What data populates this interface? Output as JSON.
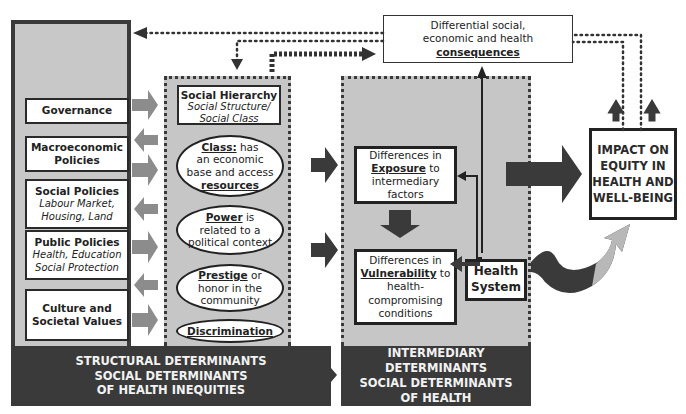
{
  "structural": {
    "policies": [
      {
        "title": "Governance",
        "subtitle": ""
      },
      {
        "title": "Macroeconomic Policies",
        "subtitle": ""
      },
      {
        "title": "Social Policies",
        "subtitle": "Labour Market, Housing, Land"
      },
      {
        "title": "Public Policies",
        "subtitle": "Health, Education Social Protection"
      },
      {
        "title": "Culture and Societal Values",
        "subtitle": ""
      }
    ],
    "label_lines": [
      "STRUCTURAL DETERMINANTS",
      "SOCIAL DETERMINANTS",
      "OF HEALTH INEQUITIES"
    ]
  },
  "hierarchy": {
    "title": "Social Hierarchy",
    "subtitle_1": "Social Structure/",
    "subtitle_2": "Social Class",
    "class": {
      "key": "Class:",
      "text_1": " has",
      "text_2": "an economic",
      "text_3": "base and access",
      "key_2": "resources"
    },
    "power": {
      "key": "Power",
      "text_1": " is",
      "text_2": "related to a",
      "text_3": "political context"
    },
    "prestige": {
      "key": "Prestige",
      "text_1": " or",
      "text_2": "honor in the",
      "text_3": "community"
    },
    "discrimination": {
      "key": "Discrimination"
    }
  },
  "intermediary": {
    "exposure": {
      "line_1": "Differences in",
      "key": "Exposure",
      "after_key": " to",
      "line_3": "intermediary",
      "line_4": "factors"
    },
    "vulnerability": {
      "line_1": "Differences in",
      "key": "Vulnerability",
      "after_key": " to",
      "line_3": "health-",
      "line_4": "compromising",
      "line_5": "conditions"
    },
    "health_system": {
      "line_1": "Health",
      "line_2": "System"
    },
    "label_lines": [
      "INTERMEDIARY DETERMINANTS",
      "SOCIAL DETERMINANTS",
      "OF HEALTH"
    ]
  },
  "consequences": {
    "line_1": "Differential social,",
    "line_2": "economic and health",
    "key": "consequences"
  },
  "impact": {
    "lines": [
      "IMPACT ON",
      "EQUITY IN",
      "HEALTH AND",
      "WELL-BEING"
    ]
  },
  "colors": {
    "dark": "#3a3a3a",
    "panel_gray": "#c6c6c6",
    "arrow_gray": "#8c8c8c",
    "light_arrow": "#b8b8b8"
  }
}
